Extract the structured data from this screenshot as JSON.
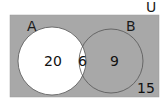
{
  "diagram": {
    "type": "venn",
    "universe_label": "U",
    "sets": [
      {
        "label": "A",
        "only_count": "20"
      },
      {
        "label": "B",
        "only_count": "9"
      }
    ],
    "intersection_count": "6",
    "outside_count": "15",
    "colors": {
      "universe_fill": "#a8a8a8",
      "set_a_fill": "#ffffff",
      "outline": "#555555"
    }
  }
}
